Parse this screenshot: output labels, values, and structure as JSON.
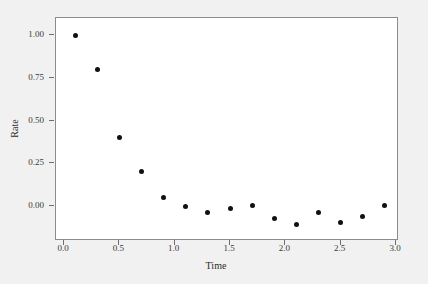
{
  "chart_data": {
    "type": "scatter",
    "title": "",
    "xlabel": "Time",
    "ylabel": "Rate",
    "xlim": [
      -0.02,
      3.02
    ],
    "ylim": [
      -0.19,
      1.07
    ],
    "grid": false,
    "legend": "none",
    "marker": {
      "shape": "circle",
      "color": "#111111",
      "size": 5
    },
    "xticks": [
      "0.0",
      "0.5",
      "1.0",
      "1.5",
      "2.0",
      "2.5",
      "3.0"
    ],
    "xtick_values": [
      0.0,
      0.5,
      1.0,
      1.5,
      2.0,
      2.5,
      3.0
    ],
    "yticks": [
      "0.00",
      "0.25",
      "0.50",
      "0.75",
      "1.00"
    ],
    "ytick_values": [
      0.0,
      0.25,
      0.5,
      0.75,
      1.0
    ],
    "x": [
      0.1,
      0.3,
      0.5,
      0.7,
      0.9,
      1.1,
      1.3,
      1.5,
      1.7,
      1.9,
      2.1,
      2.3,
      2.5,
      2.7,
      2.9
    ],
    "y": [
      1.0,
      0.8,
      0.4,
      0.2,
      0.05,
      0.0,
      -0.04,
      -0.015,
      0.005,
      -0.075,
      -0.11,
      -0.04,
      -0.095,
      -0.06,
      0.005
    ],
    "series": [
      {
        "name": "Rate",
        "points": [
          {
            "x": 0.1,
            "y": 1.0
          },
          {
            "x": 0.3,
            "y": 0.8
          },
          {
            "x": 0.5,
            "y": 0.4
          },
          {
            "x": 0.7,
            "y": 0.2
          },
          {
            "x": 0.9,
            "y": 0.05
          },
          {
            "x": 1.1,
            "y": 0.0
          },
          {
            "x": 1.3,
            "y": -0.04
          },
          {
            "x": 1.5,
            "y": -0.015
          },
          {
            "x": 1.7,
            "y": 0.005
          },
          {
            "x": 1.9,
            "y": -0.075
          },
          {
            "x": 2.1,
            "y": -0.11
          },
          {
            "x": 2.3,
            "y": -0.04
          },
          {
            "x": 2.5,
            "y": -0.095
          },
          {
            "x": 2.7,
            "y": -0.06
          },
          {
            "x": 2.9,
            "y": 0.005
          }
        ]
      }
    ],
    "colors": {
      "marker": "#111111",
      "plot_background": "#ffffff",
      "figure_background": "#f1f1f1",
      "axis": "#8c8c8c",
      "tick_text": "#3a3a3a",
      "axis_label": "#2b2b2b"
    }
  }
}
